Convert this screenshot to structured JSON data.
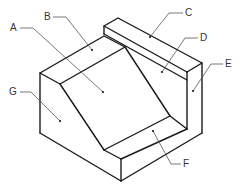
{
  "diagram": {
    "type": "isometric-block-face-labels",
    "line_color": "#1a1a1a",
    "leader_color": "#555555",
    "labels": [
      {
        "id": "A",
        "text": "A",
        "x": 10,
        "y": 24
      },
      {
        "id": "B",
        "text": "B",
        "x": 44,
        "y": 13
      },
      {
        "id": "C",
        "text": "C",
        "x": 185,
        "y": 9
      },
      {
        "id": "D",
        "text": "D",
        "x": 200,
        "y": 34
      },
      {
        "id": "E",
        "text": "E",
        "x": 225,
        "y": 60
      },
      {
        "id": "F",
        "text": "F",
        "x": 183,
        "y": 159
      },
      {
        "id": "G",
        "text": "G",
        "x": 11,
        "y": 89
      }
    ]
  }
}
